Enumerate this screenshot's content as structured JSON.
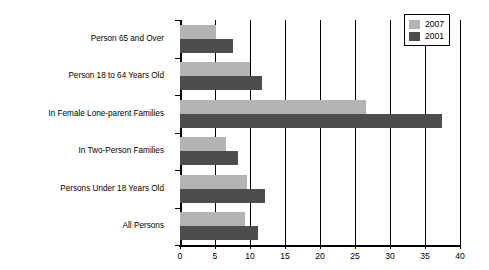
{
  "chart_data": {
    "type": "bar",
    "orientation": "horizontal",
    "title": "",
    "subtitle": "",
    "xlabel": "",
    "ylabel": "",
    "xlim": [
      0,
      40
    ],
    "ylim": null,
    "xticks": [
      0,
      5,
      10,
      15,
      20,
      25,
      30,
      35,
      40
    ],
    "xtick_labels": [
      "0",
      "5",
      "10",
      "15",
      "20",
      "25",
      "30",
      "35",
      "40"
    ],
    "grid": "vertical",
    "legend_position": "top-right",
    "categories": [
      "Person 65 and Over",
      "Person 18 to 64 Years Old",
      "In Female Lone-parent Families",
      "In Two-Person Families",
      "Persons Under 18 Years Old",
      "All Persons"
    ],
    "series": [
      {
        "name": "2007",
        "color": "#b3b3b3",
        "values": [
          5.1,
          10.0,
          26.6,
          6.6,
          9.6,
          9.3
        ]
      },
      {
        "name": "2001",
        "color": "#4d4d4d",
        "values": [
          7.5,
          11.7,
          37.4,
          8.3,
          12.1,
          11.1
        ]
      }
    ],
    "annotations": []
  },
  "legend": {
    "entries": [
      {
        "label": "2007",
        "swatch": "series-a"
      },
      {
        "label": "2001",
        "swatch": "series-b"
      }
    ]
  },
  "colors": {
    "series_2007": "#b3b3b3",
    "series_2001": "#4d4d4d",
    "axis": "#000000",
    "background": "#ffffff"
  }
}
